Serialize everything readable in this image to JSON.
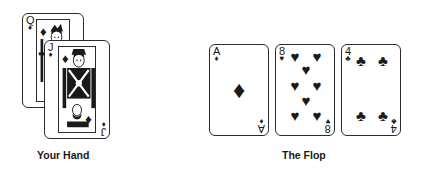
{
  "figure": {
    "background_color": "#ffffff",
    "ink_color": "#1a1a1a"
  },
  "hand": {
    "caption": "Your Hand",
    "cards": [
      {
        "rank": "Q",
        "suit": "diamonds",
        "suit_symbol": "♦",
        "name": "Queen of Diamonds",
        "type": "face"
      },
      {
        "rank": "J",
        "suit": "diamonds",
        "suit_symbol": "♦",
        "name": "Jack of Diamonds",
        "type": "face"
      }
    ]
  },
  "flop": {
    "caption": "The Flop",
    "cards": [
      {
        "rank": "A",
        "suit": "diamonds",
        "suit_symbol": "♦",
        "name": "Ace of Diamonds",
        "type": "ace",
        "pip_count": 1
      },
      {
        "rank": "8",
        "suit": "hearts",
        "suit_symbol": "♥",
        "name": "Eight of Hearts",
        "type": "numbered",
        "pip_count": 8
      },
      {
        "rank": "4",
        "suit": "clubs",
        "suit_symbol": "♣",
        "name": "Four of Clubs",
        "type": "numbered",
        "pip_count": 4
      }
    ]
  }
}
